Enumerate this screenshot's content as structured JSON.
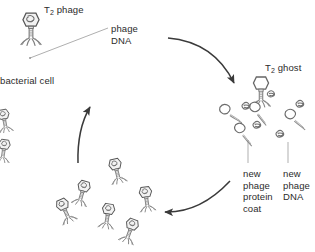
{
  "figure": {
    "background_color": "#ffffff",
    "ink_color": "#3a3a3a",
    "leader_color": "#8d8d8d"
  },
  "labels": {
    "t2_phage": {
      "text": "T",
      "subscript": "2",
      "suffix": " phage",
      "x": 44,
      "y": 4
    },
    "phage_dna": {
      "text": "phage\nDNA",
      "x": 111,
      "y": 23
    },
    "bacterial_cell": {
      "text": "bacterial cell",
      "x": 0,
      "y": 75
    },
    "t2_ghost": {
      "text": "T",
      "subscript": "2",
      "suffix": " ghost",
      "x": 265,
      "y": 62
    },
    "new_phage_protein_coat": {
      "text": "new\nphage\nprotein\ncoat",
      "x": 243,
      "y": 168
    },
    "new_phage_dna": {
      "text": "new\nphage\nDNA",
      "x": 283,
      "y": 168
    }
  },
  "icons": {
    "phage_full": "bacteriophage-with-dna-icon",
    "phage_ghost": "empty-phage-ghost-icon",
    "phage_coat": "empty-phage-protein-coat-icon",
    "dna_coil": "free-phage-dna-coil-icon",
    "arrow_curved": "curved-flow-arrow-icon"
  },
  "arrows": [
    {
      "name": "arrow-infection-up",
      "direction": "up",
      "description": "left curved arrow pointing up toward bacterial cell"
    },
    {
      "name": "arrow-to-ghost",
      "direction": "right-down",
      "description": "top arrow curving right toward T2 ghost"
    },
    {
      "name": "arrow-release",
      "direction": "left",
      "description": "bottom arrow curving left toward released phage particles"
    }
  ],
  "particles": {
    "released_cluster_count": 6,
    "new_coat_count": 4,
    "new_dna_count": 5,
    "edge_phage_count": 2
  }
}
